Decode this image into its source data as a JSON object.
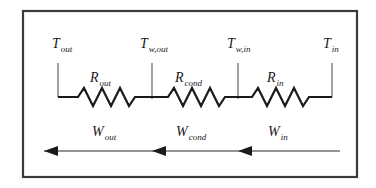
{
  "figure": {
    "background_color": "#ffffff",
    "frame_color": "#3a3a3a",
    "line_color": "#1a1a1a"
  },
  "temperature_nodes": [
    {
      "id": "t-out",
      "symbol": "T",
      "subscript": "out",
      "x": 58,
      "label_x": 52,
      "label_y": 48
    },
    {
      "id": "t-w-out",
      "symbol": "T",
      "subscript": "w,out",
      "x": 152,
      "label_x": 140,
      "label_y": 48
    },
    {
      "id": "t-w-in",
      "symbol": "T",
      "subscript": "w,in",
      "x": 238,
      "label_x": 227,
      "label_y": 48
    },
    {
      "id": "t-in",
      "symbol": "T",
      "subscript": "in",
      "x": 332,
      "label_x": 323,
      "label_y": 48
    }
  ],
  "resistors": [
    {
      "id": "r-out",
      "symbol": "R",
      "subscript": "out",
      "label_x": 90,
      "label_y": 82
    },
    {
      "id": "r-cond",
      "symbol": "R",
      "subscript": "cond",
      "label_x": 175,
      "label_y": 82
    },
    {
      "id": "r-in",
      "symbol": "R",
      "subscript": "in",
      "label_x": 267,
      "label_y": 82
    }
  ],
  "heat_flows": [
    {
      "id": "w-out",
      "symbol": "W",
      "subscript": "out",
      "label_x": 92,
      "label_y": 136
    },
    {
      "id": "w-cond",
      "symbol": "W",
      "subscript": "cond",
      "label_x": 176,
      "label_y": 136
    },
    {
      "id": "w-in",
      "symbol": "W",
      "subscript": "in",
      "label_x": 268,
      "label_y": 136
    }
  ],
  "arrow_direction": "left",
  "arrow_count": 3
}
